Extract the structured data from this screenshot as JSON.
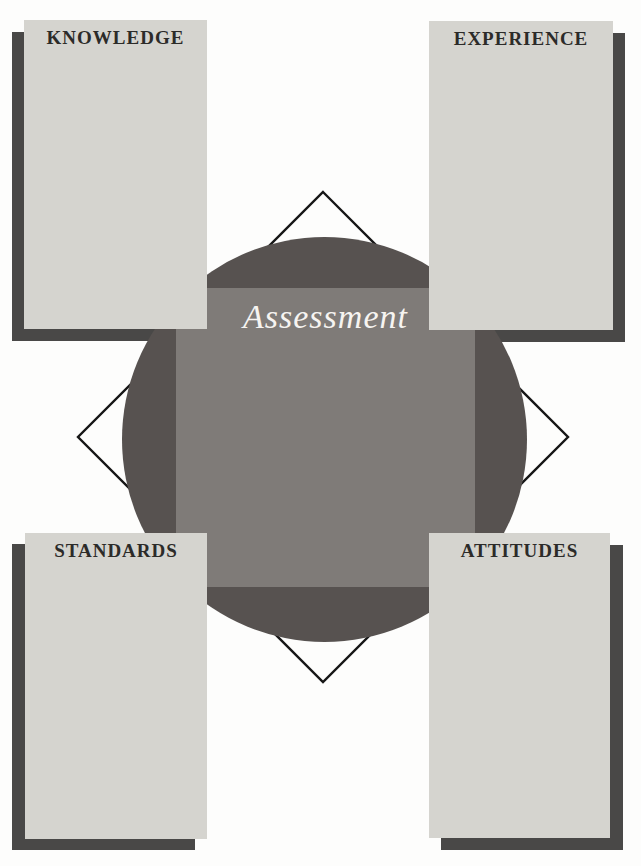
{
  "figure": {
    "center_label": "Assessment",
    "panels": [
      {
        "id": "knowledge",
        "label": "KNOWLEDGE",
        "position": "top-left"
      },
      {
        "id": "experience",
        "label": "EXPERIENCE",
        "position": "top-right"
      },
      {
        "id": "standards",
        "label": "STANDARDS",
        "position": "bottom-left"
      },
      {
        "id": "attitudes",
        "label": "ATTITUDES",
        "position": "bottom-right"
      }
    ]
  },
  "colors": {
    "background": "#fdfdfc",
    "panel": "#d5d4cf",
    "shadow": "#494847",
    "circle": "#575250",
    "square": "#7f7b78",
    "label-text": "#2c2b29",
    "assessment-text": "#f6f4f1",
    "diamond-stroke": "#161616"
  }
}
